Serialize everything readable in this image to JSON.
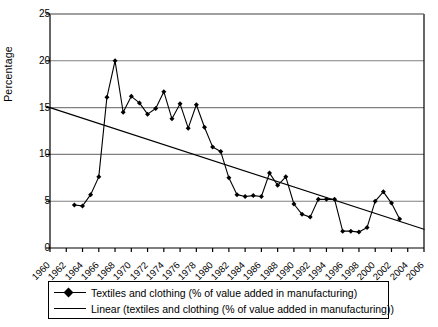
{
  "chart_data": {
    "type": "line",
    "title": "",
    "xlabel": "",
    "ylabel": "Percentage",
    "xlim": [
      1960,
      2006
    ],
    "ylim": [
      0,
      25
    ],
    "ytick_values": [
      0,
      5,
      10,
      15,
      20,
      25
    ],
    "xtick_values": [
      1960,
      1962,
      1964,
      1966,
      1968,
      1970,
      1972,
      1974,
      1976,
      1978,
      1980,
      1982,
      1984,
      1986,
      1988,
      1990,
      1992,
      1994,
      1996,
      1998,
      2000,
      2002,
      2004,
      2006
    ],
    "xtick_labels": [
      "1960",
      "1962",
      "1964",
      "1966",
      "1968",
      "1970",
      "1972",
      "1974",
      "1976",
      "1978",
      "1980",
      "1982",
      "1984",
      "1986",
      "1988",
      "1990",
      "1992",
      "1994",
      "1996",
      "1998",
      "2000",
      "2002",
      "2004",
      "2006"
    ],
    "ytick_labels": [
      "0",
      "5",
      "10",
      "15",
      "20",
      "25"
    ],
    "grid": "horizontal",
    "legend_position": "bottom",
    "series": [
      {
        "name": "Textiles and clothing (% of value added in manufacturing)",
        "marker": "diamond",
        "x": [
          1963,
          1964,
          1965,
          1966,
          1967,
          1968,
          1969,
          1970,
          1971,
          1972,
          1973,
          1974,
          1975,
          1976,
          1977,
          1978,
          1979,
          1980,
          1981,
          1982,
          1983,
          1984,
          1985,
          1986,
          1987,
          1988,
          1989,
          1990,
          1991,
          1992,
          1993,
          1994,
          1995,
          1996,
          1997,
          1998,
          1999,
          2000,
          2001,
          2002,
          2003
        ],
        "values": [
          4.6,
          4.5,
          5.7,
          7.6,
          16.1,
          20.0,
          14.5,
          16.2,
          15.5,
          14.3,
          14.9,
          16.7,
          13.8,
          15.4,
          12.8,
          15.3,
          12.9,
          10.8,
          10.3,
          7.5,
          5.7,
          5.5,
          5.6,
          5.5,
          8.0,
          6.7,
          7.6,
          4.7,
          3.6,
          3.3,
          5.2,
          5.2,
          5.2,
          1.8,
          1.8,
          1.7,
          2.2,
          5.0,
          6.0,
          4.8,
          3.1
        ]
      },
      {
        "name": "Linear (textiles and clothing (% of value added in manufacturing))",
        "marker": "none",
        "x": [
          1960,
          2006
        ],
        "values": [
          15.0,
          2.0
        ]
      }
    ],
    "legend": [
      "Textiles and clothing (% of value added in manufacturing)",
      "Linear (textiles and clothing (% of value added in manufacturing))"
    ]
  },
  "colors": {
    "line": "#000000",
    "grid": "#808080",
    "axis": "#000000",
    "background": "#ffffff"
  }
}
